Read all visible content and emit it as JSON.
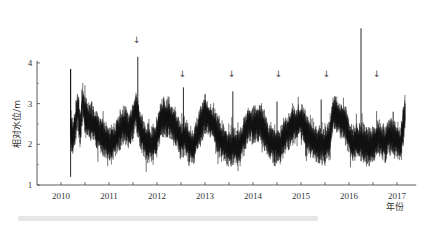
{
  "chart_data": {
    "type": "line",
    "title": "",
    "xlabel": "年份",
    "ylabel": "相对水位/m",
    "xlim": [
      2010.0,
      2017.9
    ],
    "ylim": [
      1,
      4.8
    ],
    "yticks": [
      1,
      2,
      3,
      4
    ],
    "yminor_ticks": [
      1.5,
      2.5,
      3.5
    ],
    "xtick_labels": [
      "2010",
      "2011",
      "2012",
      "2013",
      "2014",
      "2015",
      "2016",
      "2017"
    ],
    "grid": false,
    "legend": null,
    "line_color": "#111111",
    "series": [
      {
        "name": "相对水位",
        "x": [
          2010.7,
          2010.75,
          2010.8,
          2010.85,
          2010.9,
          2010.95,
          2011.0,
          2011.08,
          2011.17,
          2011.25,
          2011.33,
          2011.42,
          2011.5,
          2011.58,
          2011.67,
          2011.75,
          2011.83,
          2011.92,
          2012.0,
          2012.06,
          2012.1,
          2012.17,
          2012.25,
          2012.33,
          2012.42,
          2012.5,
          2012.58,
          2012.67,
          2012.75,
          2012.83,
          2012.92,
          2013.0,
          2013.05,
          2013.08,
          2013.17,
          2013.25,
          2013.33,
          2013.42,
          2013.5,
          2013.58,
          2013.67,
          2013.75,
          2013.83,
          2013.92,
          2014.0,
          2014.08,
          2014.1,
          2014.17,
          2014.25,
          2014.33,
          2014.42,
          2014.5,
          2014.58,
          2014.67,
          2014.75,
          2014.83,
          2014.92,
          2015.0,
          2015.08,
          2015.1,
          2015.17,
          2015.25,
          2015.33,
          2015.42,
          2015.5,
          2015.58,
          2015.67,
          2015.75,
          2015.83,
          2015.92,
          2016.0,
          2016.08,
          2016.1,
          2016.17,
          2016.25,
          2016.33,
          2016.42,
          2016.5,
          2016.58,
          2016.67,
          2016.75,
          2016.83,
          2016.92,
          2017.0,
          2017.08,
          2017.1,
          2017.17,
          2017.25,
          2017.33,
          2017.42,
          2017.5,
          2017.58,
          2017.67
        ],
        "y": [
          3.85,
          2.2,
          2.5,
          2.9,
          2.3,
          3.1,
          2.7,
          2.6,
          2.5,
          2.35,
          2.2,
          2.1,
          2.0,
          2.05,
          2.2,
          2.4,
          2.5,
          2.3,
          2.6,
          2.9,
          4.15,
          2.3,
          2.1,
          2.0,
          2.0,
          2.2,
          2.6,
          2.7,
          2.6,
          2.5,
          2.3,
          2.1,
          3.4,
          2.2,
          2.0,
          1.95,
          2.2,
          2.5,
          2.75,
          2.6,
          2.5,
          2.3,
          2.1,
          2.0,
          1.9,
          3.3,
          2.0,
          1.9,
          2.0,
          2.3,
          2.55,
          2.45,
          2.5,
          2.5,
          2.3,
          2.1,
          2.0,
          3.05,
          1.95,
          2.1,
          2.2,
          2.35,
          2.5,
          2.5,
          2.6,
          2.4,
          2.2,
          2.1,
          2.0,
          3.1,
          2.0,
          2.1,
          2.2,
          2.8,
          2.7,
          2.6,
          2.5,
          2.2,
          2.0,
          2.1,
          4.85,
          2.0,
          1.9,
          2.0,
          2.1,
          2.2,
          2.1,
          2.0,
          2.2,
          2.8,
          2.1,
          2.0,
          2.8
        ]
      }
    ],
    "annotations": [
      {
        "type": "arrow-down",
        "x": 2012.1,
        "label": "↓"
      },
      {
        "type": "arrow-down",
        "x": 2013.05,
        "label": "↓"
      },
      {
        "type": "arrow-down",
        "x": 2014.08,
        "label": "↓"
      },
      {
        "type": "arrow-down",
        "x": 2015.05,
        "label": "↓"
      },
      {
        "type": "arrow-down",
        "x": 2016.05,
        "label": "↓"
      },
      {
        "type": "arrow-down",
        "x": 2017.1,
        "label": "↓"
      }
    ]
  },
  "axes": {
    "ylabel": "相对水位/m",
    "xlabel": "年份",
    "y_tick_labels": [
      "1",
      "2",
      "3",
      "4"
    ],
    "x_tick_labels": [
      "2010",
      "2011",
      "2012",
      "2013",
      "2014",
      "2015",
      "2016",
      "2017"
    ]
  }
}
